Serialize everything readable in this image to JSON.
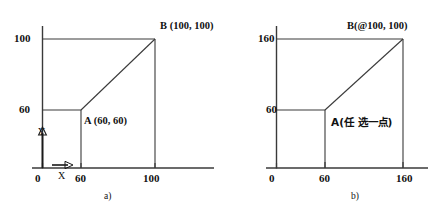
{
  "figure": {
    "panels": [
      {
        "id": "a",
        "caption": "a)",
        "axis_x_label": "X",
        "axis_y_label": "Y",
        "y_ticks": [
          "100",
          "60"
        ],
        "x_ticks": [
          "0",
          "60",
          "100"
        ],
        "point_b_label": "B (100, 100)",
        "point_a_label": "A (60, 60)"
      },
      {
        "id": "b",
        "caption": "b)",
        "y_ticks": [
          "160",
          "60"
        ],
        "x_ticks": [
          "0",
          "60",
          "160"
        ],
        "point_b_label": "B(@100, 100)",
        "point_a_label": "A(任 选一点)"
      }
    ],
    "line_color": "#3a3a3a",
    "text_color": "#111111",
    "background_color": "#ffffff"
  }
}
